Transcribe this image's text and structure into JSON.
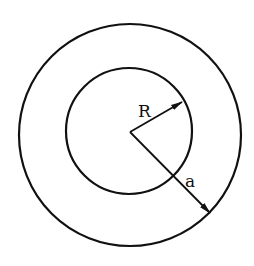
{
  "diagram": {
    "type": "concentric-circles",
    "stroke_color": "#111111",
    "background": "#ffffff",
    "center": {
      "x": 130,
      "y": 132
    },
    "outer_circle": {
      "cx": 130,
      "cy": 135,
      "r": 111
    },
    "inner_circle": {
      "cx": 129,
      "cy": 131,
      "r": 63
    },
    "arrows": [
      {
        "label": "R",
        "from": {
          "x": 130,
          "y": 132
        },
        "to": {
          "x": 182,
          "y": 102
        }
      },
      {
        "label": "a",
        "from": {
          "x": 130,
          "y": 132
        },
        "to": {
          "x": 210,
          "y": 213
        }
      }
    ],
    "labels": {
      "inner_radius": "R",
      "outer_radius": "a"
    }
  }
}
